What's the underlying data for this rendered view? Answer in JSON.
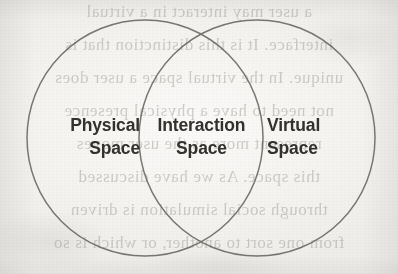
{
  "figure": {
    "type": "venn-diagram-2-set",
    "background_color": "#f3f2ef",
    "stroke_color": "#6f6b64",
    "text_color": "#33312e",
    "regions": [
      {
        "id": "physical",
        "name": "Physical Space",
        "line1": "Physical",
        "line2": "Space",
        "position": "left-circle-only"
      },
      {
        "id": "interaction",
        "name": "Interaction Space",
        "line1": "Interaction",
        "line2": "Space",
        "position": "overlap"
      },
      {
        "id": "virtual",
        "name": "Virtual Space",
        "line1": "Virtual",
        "line2": "Space",
        "position": "right-circle-only"
      }
    ],
    "circles": [
      {
        "id": "left-circle",
        "cx": 145,
        "cy": 138,
        "r": 118
      },
      {
        "id": "right-circle",
        "cx": 257,
        "cy": 138,
        "r": 118
      }
    ]
  },
  "bleed_through": {
    "note": "faint mirrored show-through text from the reverse side of the scanned page",
    "lines": [
      "a user may interact in a virtual",
      "interface. It is this distinction that is",
      "unique. In the virtual space a user does",
      "not need to have a physical presence",
      "represent more as the user moves",
      "this space. As we have discussed",
      "through social simulation is driven",
      "from one sort to another, or which is so"
    ]
  }
}
